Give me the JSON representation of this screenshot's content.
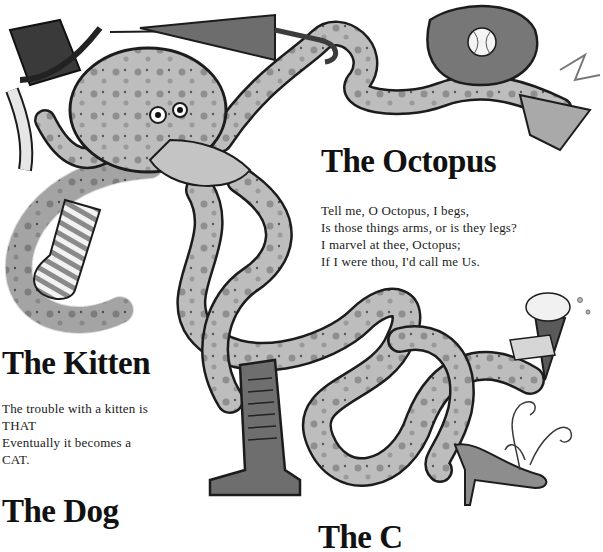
{
  "page": {
    "poems": [
      {
        "id": "octopus",
        "title": "The Octopus",
        "lines": [
          "Tell me, O Octopus, I begs,",
          "Is those things arms, or is they legs?",
          "I marvel at thee, Octopus;",
          "If I were thou, I'd call me Us."
        ]
      },
      {
        "id": "kitten",
        "title": "The Kitten",
        "lines": [
          "The trouble with a kitten is",
          "THAT",
          "Eventually it becomes a",
          "CAT."
        ]
      },
      {
        "id": "dog",
        "title": "The Dog",
        "lines": []
      },
      {
        "id": "cut-off",
        "title": "The C",
        "lines": []
      }
    ],
    "illustration": {
      "subject": "octopus",
      "items": [
        "top-hat",
        "umbrella",
        "baseball-glove",
        "baseball",
        "ballet-slipper",
        "striped-sock",
        "combat-boot",
        "ice-cream-cone",
        "high-heel-shoe",
        "feather-plume"
      ],
      "colors": {
        "outline": "#1c1c1c",
        "skin": "#b9b9b9",
        "skin_light": "#d6d6d6",
        "spots": "#8a8a8a",
        "dark": "#4a4a4a"
      }
    }
  }
}
